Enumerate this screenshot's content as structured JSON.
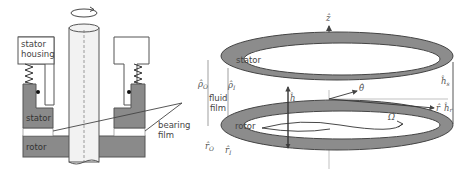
{
  "figure": {
    "left_panel": {
      "labels": {
        "stator_housing_line1": "stator",
        "stator_housing_line2": "housing",
        "stator": "stator",
        "rotor": "rotor",
        "bearing_film_line1": "bearing",
        "bearing_film_line2": "film"
      },
      "colors": {
        "component_fill": "#8a8a8a",
        "housing_fill": "#ffffff",
        "shaft_fill": "#f2f2f2",
        "outline": "#555555"
      }
    },
    "right_panel": {
      "labels": {
        "stator": "stator",
        "rotor": "rotor",
        "fluid_film_line1": "fluid",
        "fluid_film_line2": "film"
      },
      "symbols": {
        "z_axis": "ẑ",
        "theta": "θ̂",
        "r_axis": "r̂",
        "h": "ĥ",
        "h_s": "ĥ",
        "h_s_sub": "s",
        "h_r": "ĥ",
        "h_r_sub": "r",
        "rho_o": "ρ̂",
        "rho_o_sub": "O",
        "rho_i": "ρ̂",
        "rho_i_sub": "I",
        "r_o": "r̂",
        "r_o_sub": "O",
        "r_i": "r̂",
        "r_i_sub": "I",
        "omega": "Ω̂"
      },
      "colors": {
        "ring_fill": "#8c8c8c",
        "ring_outline": "#444444"
      }
    }
  }
}
